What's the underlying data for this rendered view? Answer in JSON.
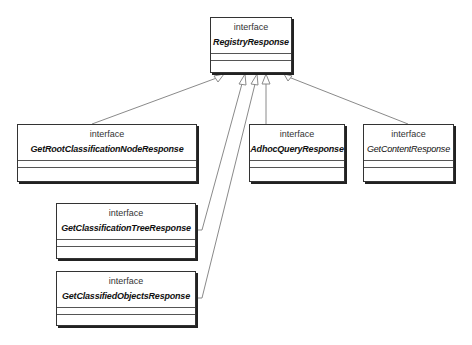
{
  "diagram": {
    "type": "uml-class-diagram",
    "colors": {
      "background": "#ffffff",
      "border": "#333333",
      "edge": "#888888",
      "text": "#111111"
    },
    "classes": [
      {
        "id": "registry",
        "stereotype": "interface",
        "name": "RegistryResponse"
      },
      {
        "id": "getroot",
        "stereotype": "interface",
        "name": "GetRootClassificationNodeResponse"
      },
      {
        "id": "adhoc",
        "stereotype": "interface",
        "name": "AdhocQueryResponse"
      },
      {
        "id": "getcontent",
        "stereotype": "interface",
        "name": "GetContentResponse"
      },
      {
        "id": "gettree",
        "stereotype": "interface",
        "name": "GetClassificationTreeResponse"
      },
      {
        "id": "getobjects",
        "stereotype": "interface",
        "name": "GetClassifiedObjectsResponse"
      }
    ],
    "relationships": [
      {
        "type": "generalization",
        "from": "GetRootClassificationNodeResponse",
        "to": "RegistryResponse"
      },
      {
        "type": "generalization",
        "from": "GetClassificationTreeResponse",
        "to": "RegistryResponse"
      },
      {
        "type": "generalization",
        "from": "GetClassifiedObjectsResponse",
        "to": "RegistryResponse"
      },
      {
        "type": "generalization",
        "from": "AdhocQueryResponse",
        "to": "RegistryResponse"
      },
      {
        "type": "generalization",
        "from": "GetContentResponse",
        "to": "RegistryResponse"
      }
    ]
  }
}
